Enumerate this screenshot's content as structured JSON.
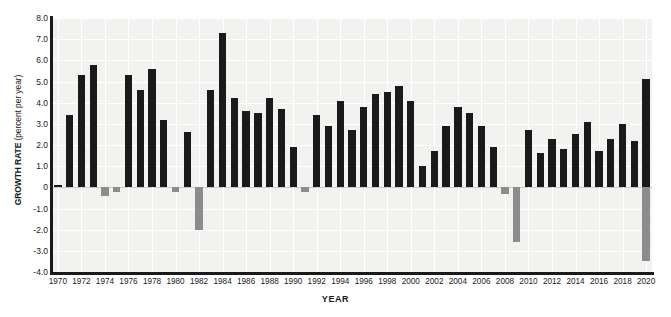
{
  "chart_data": {
    "type": "bar",
    "title": "",
    "xlabel": "YEAR",
    "ylabel": "GROWTH RATE (percent per year)",
    "ylabel_strong": "GROWTH RATE",
    "ylabel_rest": " (percent per year)",
    "ylim": [
      -4.0,
      8.0
    ],
    "xlim": [
      1969.5,
      2020.5
    ],
    "grid": true,
    "legend": "none",
    "y_ticks": [
      "8.0",
      "7.0",
      "6.0",
      "5.0",
      "4.0",
      "3.0",
      "2.0",
      "1.0",
      "0",
      "-1.0",
      "-2.0",
      "-3.0",
      "-4.0"
    ],
    "y_tick_values": [
      8.0,
      7.0,
      6.0,
      5.0,
      4.0,
      3.0,
      2.0,
      1.0,
      0,
      -1.0,
      -2.0,
      -3.0,
      -4.0
    ],
    "x_ticks": [
      "1970",
      "1972",
      "1974",
      "1976",
      "1978",
      "1980",
      "1982",
      "1984",
      "1986",
      "1988",
      "1990",
      "1992",
      "1994",
      "1996",
      "1998",
      "2000",
      "2002",
      "2004",
      "2006",
      "2008",
      "2010",
      "2012",
      "2014",
      "2016",
      "2018",
      "2020"
    ],
    "positive_color": "#1a1a1a",
    "negative_color": "#8c8c8c",
    "plot_background": "#f2f2f0",
    "gridline_color": "#ffffff",
    "categories": [
      1970,
      1971,
      1972,
      1973,
      1974,
      1975,
      1976,
      1977,
      1978,
      1979,
      1980,
      1981,
      1982,
      1983,
      1984,
      1985,
      1986,
      1987,
      1988,
      1989,
      1990,
      1991,
      1992,
      1993,
      1994,
      1995,
      1996,
      1997,
      1998,
      1999,
      2000,
      2001,
      2002,
      2003,
      2004,
      2005,
      2006,
      2007,
      2008,
      2009,
      2010,
      2011,
      2012,
      2013,
      2014,
      2015,
      2016,
      2017,
      2018,
      2019,
      2020
    ],
    "values": [
      0.1,
      3.4,
      5.3,
      5.8,
      -0.4,
      -0.2,
      5.3,
      4.6,
      5.6,
      3.2,
      -0.2,
      2.6,
      -2.0,
      4.6,
      7.3,
      4.2,
      3.6,
      3.5,
      4.2,
      3.7,
      1.9,
      -0.2,
      3.4,
      2.9,
      4.1,
      2.7,
      3.8,
      4.4,
      4.5,
      4.8,
      4.1,
      1.0,
      1.7,
      2.9,
      3.8,
      3.5,
      2.9,
      1.9,
      -0.3,
      -2.6,
      2.7,
      1.6,
      2.3,
      1.8,
      2.5,
      3.1,
      1.7,
      2.3,
      3.0,
      2.2,
      5.1
    ],
    "secondary_values": [
      null,
      null,
      null,
      null,
      null,
      null,
      null,
      null,
      null,
      null,
      null,
      null,
      null,
      null,
      null,
      null,
      null,
      null,
      null,
      null,
      null,
      null,
      null,
      null,
      null,
      null,
      null,
      null,
      null,
      null,
      null,
      null,
      null,
      null,
      null,
      null,
      null,
      null,
      null,
      null,
      null,
      null,
      null,
      null,
      null,
      null,
      null,
      null,
      null,
      null,
      -3.5
    ],
    "notable": {
      "maximum": {
        "year": 1984,
        "value": 7.3
      },
      "minimum": {
        "year": 2020,
        "value": -3.5
      },
      "recession_years": [
        1974,
        1975,
        1980,
        1982,
        1991,
        2008,
        2009,
        2020
      ]
    }
  }
}
